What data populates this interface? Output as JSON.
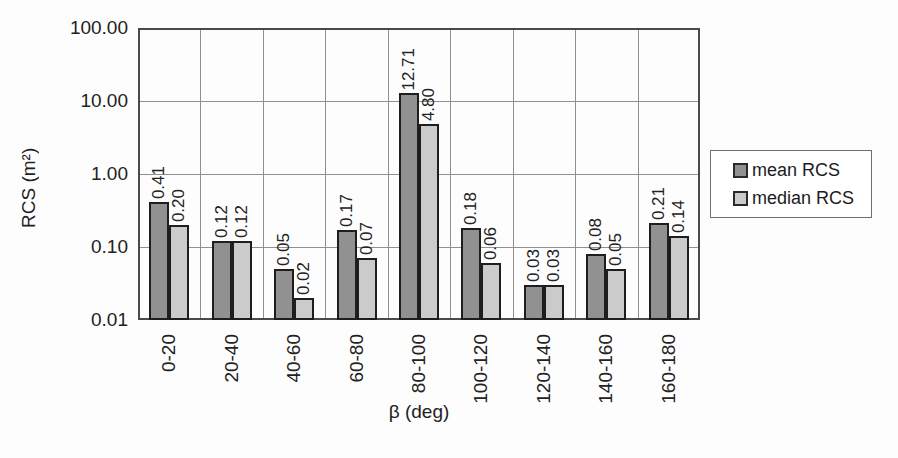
{
  "chart_data": {
    "type": "bar",
    "title": "",
    "xlabel": "β (deg)",
    "ylabel": "RCS (m²)",
    "y_scale": "log",
    "ylim": [
      0.01,
      100
    ],
    "y_ticks": [
      "100.00",
      "10.00",
      "1.00",
      "0.10",
      "0.01"
    ],
    "categories": [
      "0-20",
      "20-40",
      "40-60",
      "60-80",
      "80-100",
      "100-120",
      "120-140",
      "140-160",
      "160-180"
    ],
    "series": [
      {
        "name": "mean RCS",
        "color": "#919191",
        "values": [
          0.41,
          0.12,
          0.05,
          0.17,
          12.71,
          0.18,
          0.03,
          0.08,
          0.21
        ],
        "labels": [
          "0.41",
          "0.12",
          "0.05",
          "0.17",
          "12.71",
          "0.18",
          "0.03",
          "0.08",
          "0.21"
        ]
      },
      {
        "name": "median RCS",
        "color": "#cbcbcb",
        "values": [
          0.2,
          0.12,
          0.02,
          0.07,
          4.8,
          0.06,
          0.03,
          0.05,
          0.14
        ],
        "labels": [
          "0.20",
          "0.12",
          "0.02",
          "0.07",
          "4.80",
          "0.06",
          "0.03",
          "0.05",
          "0.14"
        ]
      }
    ],
    "grid": true,
    "legend_position": "right"
  }
}
